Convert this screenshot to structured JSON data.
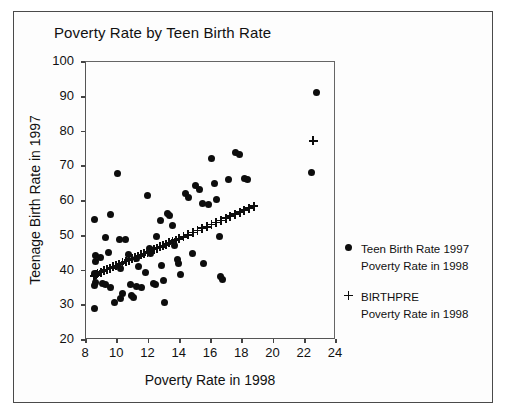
{
  "chart_data": {
    "type": "scatter",
    "title": "Poverty Rate by Teen Birth Rate",
    "xlabel": "Poverty Rate in 1998",
    "ylabel": "Teenage Birth Rate in 1997",
    "xlim": [
      8,
      24
    ],
    "ylim": [
      20,
      100
    ],
    "xticks": [
      8,
      10,
      12,
      14,
      16,
      18,
      20,
      22,
      24
    ],
    "yticks": [
      20,
      30,
      40,
      50,
      60,
      70,
      80,
      90,
      100
    ],
    "grid": false,
    "legend_position": "right",
    "series": [
      {
        "name": "Teen Birth Rate 1997",
        "sublabel": "Poverty Rate in 1998",
        "marker": "circle",
        "color": "#0d0d0d",
        "points": [
          [
            8.6,
            54.5
          ],
          [
            8.7,
            44.0
          ],
          [
            8.7,
            42.3
          ],
          [
            8.6,
            38.8
          ],
          [
            8.7,
            36.2
          ],
          [
            8.6,
            35.4
          ],
          [
            8.6,
            28.8
          ],
          [
            9.0,
            43.5
          ],
          [
            9.1,
            36.0
          ],
          [
            9.3,
            35.6
          ],
          [
            9.6,
            34.9
          ],
          [
            9.3,
            49.2
          ],
          [
            9.6,
            55.8
          ],
          [
            9.5,
            44.8
          ],
          [
            9.9,
            30.6
          ],
          [
            10.1,
            67.5
          ],
          [
            10.2,
            48.7
          ],
          [
            10.3,
            40.2
          ],
          [
            10.4,
            33.1
          ],
          [
            10.3,
            31.6
          ],
          [
            10.6,
            48.6
          ],
          [
            10.8,
            44.2
          ],
          [
            10.9,
            35.8
          ],
          [
            11.0,
            32.5
          ],
          [
            11.1,
            31.8
          ],
          [
            11.3,
            43.3
          ],
          [
            11.4,
            41.0
          ],
          [
            11.3,
            35.2
          ],
          [
            11.6,
            34.9
          ],
          [
            11.9,
            39.2
          ],
          [
            12.0,
            61.2
          ],
          [
            12.1,
            46.0
          ],
          [
            12.2,
            44.7
          ],
          [
            12.4,
            36.0
          ],
          [
            12.5,
            35.6
          ],
          [
            12.6,
            49.5
          ],
          [
            12.8,
            54.0
          ],
          [
            12.9,
            41.2
          ],
          [
            13.0,
            36.8
          ],
          [
            13.1,
            30.4
          ],
          [
            13.3,
            56.2
          ],
          [
            13.4,
            55.4
          ],
          [
            13.6,
            52.8
          ],
          [
            13.7,
            47.0
          ],
          [
            13.9,
            43.0
          ],
          [
            14.0,
            41.6
          ],
          [
            14.1,
            38.5
          ],
          [
            14.4,
            62.0
          ],
          [
            14.6,
            60.8
          ],
          [
            14.9,
            44.5
          ],
          [
            15.1,
            64.2
          ],
          [
            15.3,
            63.0
          ],
          [
            15.5,
            59.0
          ],
          [
            15.6,
            41.8
          ],
          [
            15.9,
            58.6
          ],
          [
            16.1,
            72.0
          ],
          [
            16.3,
            64.8
          ],
          [
            16.4,
            60.2
          ],
          [
            16.6,
            49.6
          ],
          [
            16.7,
            38.0
          ],
          [
            16.8,
            37.2
          ],
          [
            17.2,
            66.0
          ],
          [
            17.6,
            73.6
          ],
          [
            17.9,
            73.2
          ],
          [
            18.2,
            66.2
          ],
          [
            18.4,
            65.8
          ],
          [
            22.5,
            68.0
          ],
          [
            22.8,
            91.0
          ]
        ]
      },
      {
        "name": "BIRTHPRE",
        "sublabel": "Poverty Rate in 1998",
        "marker": "plus",
        "color": "#0d0d0d",
        "points": [
          [
            8.6,
            38.2
          ],
          [
            8.7,
            38.5
          ],
          [
            8.8,
            38.8
          ],
          [
            9.0,
            39.2
          ],
          [
            9.2,
            39.6
          ],
          [
            9.4,
            40.0
          ],
          [
            9.6,
            40.4
          ],
          [
            9.8,
            40.8
          ],
          [
            10.0,
            41.1
          ],
          [
            10.2,
            41.5
          ],
          [
            10.4,
            41.9
          ],
          [
            10.6,
            42.3
          ],
          [
            10.8,
            42.7
          ],
          [
            11.0,
            43.1
          ],
          [
            11.2,
            43.4
          ],
          [
            11.4,
            43.8
          ],
          [
            11.6,
            44.2
          ],
          [
            11.8,
            44.6
          ],
          [
            12.0,
            45.0
          ],
          [
            12.2,
            45.4
          ],
          [
            12.4,
            45.8
          ],
          [
            12.6,
            46.1
          ],
          [
            12.8,
            46.5
          ],
          [
            13.0,
            46.9
          ],
          [
            13.2,
            47.3
          ],
          [
            13.4,
            47.7
          ],
          [
            13.6,
            48.1
          ],
          [
            13.8,
            48.4
          ],
          [
            14.0,
            48.8
          ],
          [
            14.3,
            49.4
          ],
          [
            14.6,
            50.0
          ],
          [
            14.9,
            50.6
          ],
          [
            15.2,
            51.2
          ],
          [
            15.5,
            51.8
          ],
          [
            15.8,
            52.3
          ],
          [
            16.1,
            52.9
          ],
          [
            16.4,
            53.5
          ],
          [
            16.7,
            54.1
          ],
          [
            17.0,
            54.7
          ],
          [
            17.3,
            55.3
          ],
          [
            17.6,
            55.9
          ],
          [
            17.9,
            56.5
          ],
          [
            18.2,
            57.0
          ],
          [
            18.5,
            57.6
          ],
          [
            18.8,
            58.2
          ],
          [
            22.6,
            77.0
          ]
        ]
      }
    ]
  },
  "legend": {
    "entries": [
      {
        "symbol": "circle-marker",
        "line1": "Teen Birth Rate 1997",
        "line2": "Poverty Rate in 1998"
      },
      {
        "symbol": "plus-marker",
        "line1": "BIRTHPRE",
        "line2": "Poverty Rate in 1998"
      }
    ]
  }
}
